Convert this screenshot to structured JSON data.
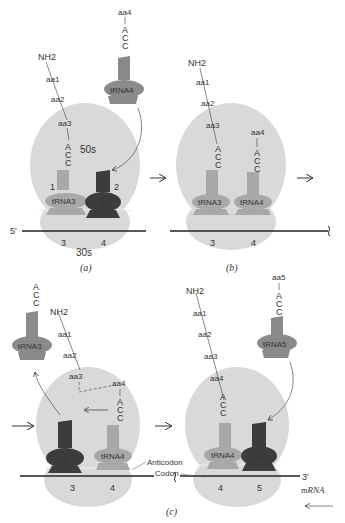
{
  "colors": {
    "ribosome": "#d9d9d9",
    "trna_light": "#a8a8a8",
    "trna_mid": "#8a8a8a",
    "trna_dark": "#3c3c3c",
    "line": "#333333"
  },
  "panels": {
    "a": {
      "label": "(a)",
      "chain": [
        "NH2",
        "aa1",
        "aa2",
        "aa3"
      ],
      "incoming_aa": "aa4",
      "acc": [
        "A",
        "C",
        "C"
      ],
      "large_subunit": "50s",
      "small_subunit": "30s",
      "site_1": "1",
      "site_2": "2",
      "trna_p": "tRNA3",
      "trna_incoming": "tRNA4",
      "trna_a_number": "4",
      "five_prime": "5′",
      "codons": [
        "3",
        "4"
      ]
    },
    "b": {
      "label": "(b)",
      "chain": [
        "NH2",
        "aa1",
        "aa2",
        "aa3"
      ],
      "aa_a_site": "aa4",
      "trna_p": "tRNA3",
      "trna_a": "tRNA4",
      "codons": [
        "3",
        "4"
      ]
    },
    "c": {
      "label": "(c)",
      "left": {
        "released_trna": "tRNA3",
        "chain": [
          "NH2",
          "aa1",
          "aa2",
          "aa3",
          "aa4"
        ],
        "trna_p_number": "3",
        "trna_a": "tRNA4",
        "codons": [
          "3",
          "4"
        ]
      },
      "right": {
        "chain": [
          "NH2",
          "aa1",
          "aa2",
          "aa3",
          "aa4"
        ],
        "incoming_aa": "aa5",
        "incoming_trna": "tRNA5",
        "trna_p": "tRNA4",
        "trna_a_number": "5",
        "codons": [
          "4",
          "5"
        ],
        "three_prime": "3′",
        "mrna": "mRNA"
      },
      "anticodon_label": "Anticodon",
      "codon_label": "Codon"
    }
  }
}
